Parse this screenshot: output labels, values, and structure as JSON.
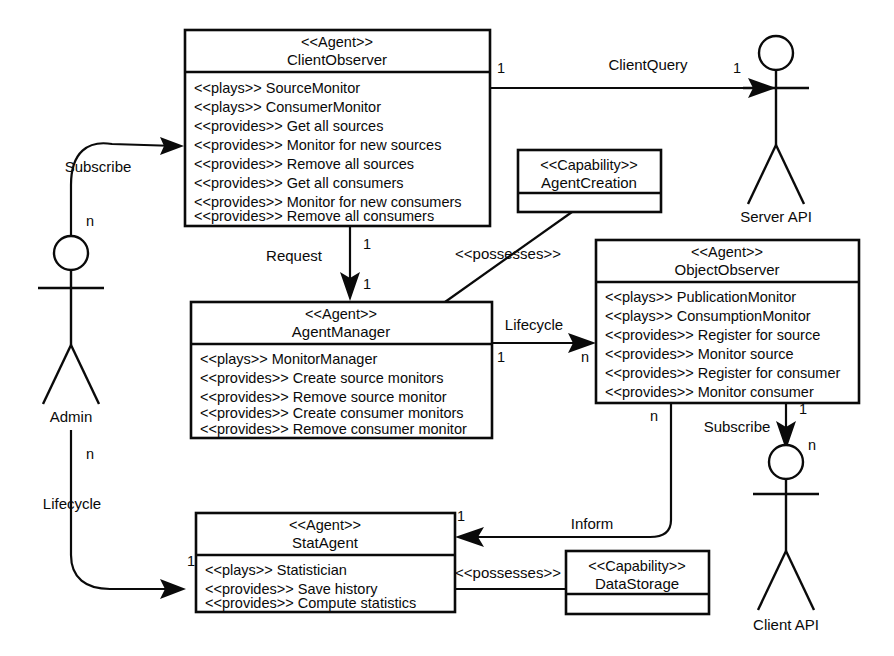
{
  "diagram": {
    "type": "uml-agent-class-diagram",
    "stroke_color": "#0a0a0a",
    "background_color": "#ffffff"
  },
  "stereotypes": {
    "agent": "<<Agent>>",
    "capability": "<<Capability>>",
    "plays": "<<plays>>",
    "provides": "<<provides>>",
    "possesses": "<<possesses>>"
  },
  "classes": [
    {
      "id": "client-observer",
      "stereotype": "<<Agent>>",
      "name": "ClientObserver",
      "features": [
        "<<plays>> SourceMonitor",
        "<<plays>> ConsumerMonitor",
        "<<provides>> Get all sources",
        "<<provides>> Monitor for new sources",
        "<<provides>> Remove all sources",
        "<<provides>> Get all consumers",
        "<<provides>> Monitor for new consumers",
        "<<provides>> Remove all consumers"
      ]
    },
    {
      "id": "agent-manager",
      "stereotype": "<<Agent>>",
      "name": "AgentManager",
      "features": [
        "<<plays>> MonitorManager",
        "<<provides>> Create source monitors",
        "<<provides>> Remove source monitor",
        "<<provides>> Create consumer monitors",
        "<<provides>> Remove consumer monitor"
      ]
    },
    {
      "id": "object-observer",
      "stereotype": "<<Agent>>",
      "name": "ObjectObserver",
      "features": [
        "<<plays>> PublicationMonitor",
        "<<plays>> ConsumptionMonitor",
        "<<provides>> Register for source",
        "<<provides>> Monitor source",
        "<<provides>> Register for consumer",
        "<<provides>> Monitor consumer"
      ]
    },
    {
      "id": "stat-agent",
      "stereotype": "<<Agent>>",
      "name": "StatAgent",
      "features": [
        "<<plays>> Statistician",
        "<<provides>> Save history",
        "<<provides>> Compute statistics"
      ]
    }
  ],
  "capabilities": [
    {
      "id": "agent-creation",
      "stereotype": "<<Capability>>",
      "name": "AgentCreation"
    },
    {
      "id": "data-storage",
      "stereotype": "<<Capability>>",
      "name": "DataStorage"
    }
  ],
  "actors": [
    {
      "id": "admin",
      "label": "Admin"
    },
    {
      "id": "server-api",
      "label": "Server API"
    },
    {
      "id": "client-api",
      "label": "Client API"
    }
  ],
  "edges": [
    {
      "id": "admin-subscribe-clientobserver",
      "label": "Subscribe",
      "from": "admin",
      "to": "client-observer",
      "source_multiplicity": "n",
      "target_multiplicity": ""
    },
    {
      "id": "clientobserver-clientquery-serverapi",
      "label": "ClientQuery",
      "from": "client-observer",
      "to": "server-api",
      "source_multiplicity": "1",
      "target_multiplicity": "1"
    },
    {
      "id": "clientobserver-request-agentmanager",
      "label": "Request",
      "from": "client-observer",
      "to": "agent-manager",
      "source_multiplicity": "1",
      "target_multiplicity": "1"
    },
    {
      "id": "agentmanager-possesses-agentcreation",
      "label": "<<possesses>>",
      "from": "agent-manager",
      "to": "agent-creation",
      "source_multiplicity": "",
      "target_multiplicity": ""
    },
    {
      "id": "agentmanager-lifecycle-objectobserver",
      "label": "Lifecycle",
      "from": "agent-manager",
      "to": "object-observer",
      "source_multiplicity": "1",
      "target_multiplicity": "n"
    },
    {
      "id": "objectobserver-subscribe-clientapi",
      "label": "Subscribe",
      "from": "object-observer",
      "to": "client-api",
      "source_multiplicity": "1",
      "target_multiplicity": "n"
    },
    {
      "id": "objectobserver-inform-statagent",
      "label": "Inform",
      "from": "object-observer",
      "to": "stat-agent",
      "source_multiplicity": "n",
      "target_multiplicity": "1"
    },
    {
      "id": "statagent-possesses-datastorage",
      "label": "<<possesses>>",
      "from": "stat-agent",
      "to": "data-storage",
      "source_multiplicity": "",
      "target_multiplicity": ""
    },
    {
      "id": "admin-lifecycle-statagent",
      "label": "Lifecycle",
      "from": "admin",
      "to": "stat-agent",
      "source_multiplicity": "n",
      "target_multiplicity": "1"
    }
  ]
}
